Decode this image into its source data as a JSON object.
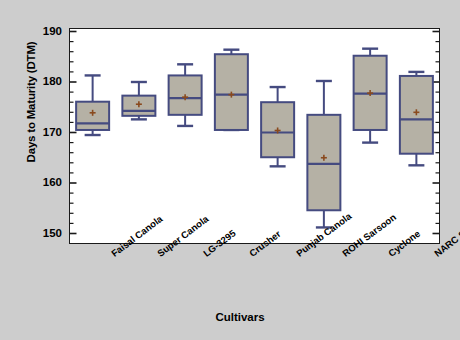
{
  "chart_data": {
    "type": "box",
    "title": "",
    "xlabel": "Cultivars",
    "ylabel": "Days to Maturity (DTM)",
    "ylim": [
      150,
      190
    ],
    "ytick_labels": [
      "150",
      "160",
      "170",
      "180",
      "190"
    ],
    "ytick_values": [
      150,
      160,
      170,
      180,
      190
    ],
    "yminor_step": 2,
    "grid": false,
    "legend": "none",
    "categories": [
      "Faisal Canola",
      "Super Canola",
      "LG-3295",
      "Crusher",
      "Punjab Canola",
      "ROHI Sarsoon",
      "Cyclone",
      "NARC Sarsoon"
    ],
    "boxes": [
      {
        "name": "Faisal Canola",
        "whisker_low": 169.5,
        "q1": 170.5,
        "median": 171.8,
        "q3": 176.1,
        "whisker_high": 181.3,
        "mean": 173.9
      },
      {
        "name": "Super Canola",
        "whisker_low": 172.6,
        "q1": 173.3,
        "median": 174.3,
        "q3": 177.3,
        "whisker_high": 180.0,
        "mean": 175.6
      },
      {
        "name": "LG-3295",
        "whisker_low": 171.3,
        "q1": 173.5,
        "median": 176.8,
        "q3": 181.3,
        "whisker_high": 183.5,
        "mean": 177.0
      },
      {
        "name": "Crusher",
        "whisker_low": 170.5,
        "q1": 170.5,
        "median": 177.5,
        "q3": 185.5,
        "whisker_high": 186.4,
        "mean": 177.5
      },
      {
        "name": "Punjab Canola",
        "whisker_low": 163.3,
        "q1": 165.1,
        "median": 170.0,
        "q3": 176.0,
        "whisker_high": 179.0,
        "mean": 170.4
      },
      {
        "name": "ROHI Sarsoon",
        "whisker_low": 151.2,
        "q1": 154.6,
        "median": 163.8,
        "q3": 173.5,
        "whisker_high": 180.2,
        "mean": 165.0
      },
      {
        "name": "Cyclone",
        "whisker_low": 168.0,
        "q1": 170.5,
        "median": 177.7,
        "q3": 185.2,
        "whisker_high": 186.6,
        "mean": 177.8
      },
      {
        "name": "NARC Sarsoon",
        "whisker_low": 163.5,
        "q1": 165.8,
        "median": 172.6,
        "q3": 181.2,
        "whisker_high": 182.0,
        "mean": 174.0
      }
    ],
    "colors": {
      "box_fill": "#b5b1a5",
      "box_edge": "#454b80",
      "whisker": "#454b80",
      "median": "#454b80",
      "mean_marker": "#8a4a1e",
      "plot_background": "#ffffff",
      "figure_background": "#cdcdcd",
      "frame": "#1a1a1a"
    }
  }
}
